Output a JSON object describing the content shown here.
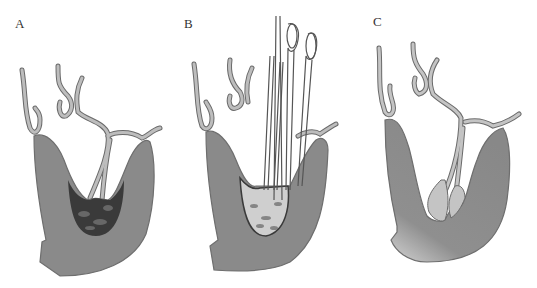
{
  "figure": {
    "panels": [
      {
        "id": "A",
        "label": "A",
        "description": "Sectioned organ filled with dark mottled contents; two ducts descend into lumen"
      },
      {
        "id": "B",
        "label": "B",
        "description": "Instruments (forceps/loop clamps and probes) inserted through ducts into lumen with lighter mottled contents"
      },
      {
        "id": "C",
        "label": "C",
        "description": "Lumen cleared; duct ends flared with pale tissue; wall shaded"
      }
    ],
    "colors": {
      "wall": "#8a8a8a",
      "wall_edge": "#6e6e6e",
      "duct_fill": "#b9b9b9",
      "duct_edge": "#6a6a6a",
      "contents_dark": "#2a2a2a",
      "contents_light": "#cfcfcf",
      "background": "#ffffff"
    }
  }
}
